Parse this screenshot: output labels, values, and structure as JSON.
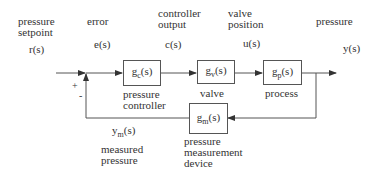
{
  "diagram": {
    "type": "feedback-control-block-diagram",
    "labels": {
      "setpoint_title_1": "pressure",
      "setpoint_title_2": "setpoint",
      "setpoint_signal": "r(s)",
      "error_title": "error",
      "error_signal": "e(s)",
      "controller_output_title_1": "controller",
      "controller_output_title_2": "output",
      "controller_output_signal": "c(s)",
      "valve_position_title_1": "valve",
      "valve_position_title_2": "position",
      "valve_position_signal": "u(s)",
      "output_title": "pressure",
      "output_signal": "y(s)",
      "plus_sign": "+",
      "minus_sign": "-",
      "measured_signal_base": "y",
      "measured_signal_sub": "m",
      "measured_signal_suffix": "(s)",
      "measured_title_1": "measured",
      "measured_title_2": "pressure"
    },
    "blocks": {
      "controller": {
        "fn_base": "g",
        "fn_sub": "c",
        "fn_suffix": "(s)",
        "caption_1": "pressure",
        "caption_2": "controller"
      },
      "valve": {
        "fn_base": "g",
        "fn_sub": "v",
        "fn_suffix": "(s)",
        "caption_1": "valve"
      },
      "process": {
        "fn_base": "g",
        "fn_sub": "p",
        "fn_suffix": "(s)",
        "caption_1": "process"
      },
      "measurement": {
        "fn_base": "g",
        "fn_sub": "m",
        "fn_suffix": "(s)",
        "caption_1": "pressure",
        "caption_2": "measurement",
        "caption_3": "device"
      }
    },
    "colors": {
      "line": "#555555",
      "text": "#333333",
      "background": "#ffffff"
    }
  }
}
